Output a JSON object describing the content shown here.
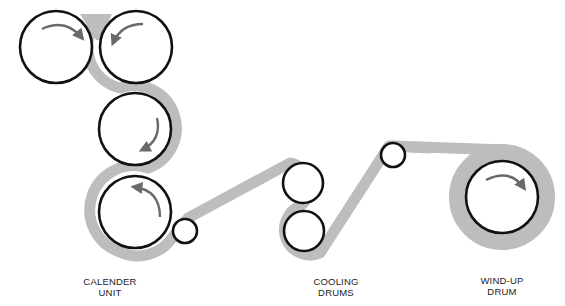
{
  "diagram": {
    "type": "calender process schematic",
    "colors": {
      "roll_outline": "#111111",
      "web_material": "#bdbdbd",
      "arrow": "#6a6a6a",
      "background": "#ffffff"
    },
    "labels": [
      {
        "id": "calender-unit",
        "line1": "CALENDER",
        "line2": "UNIT"
      },
      {
        "id": "cooling-drums",
        "line1": "COOLING",
        "line2": "DRUMS"
      },
      {
        "id": "wind-up-drum",
        "line1": "WIND-UP",
        "line2": "DRUM"
      }
    ],
    "rolls": [
      {
        "name": "calender-roll-1",
        "cx": 56,
        "cy": 47,
        "r": 36,
        "rotation": "clockwise"
      },
      {
        "name": "calender-roll-2",
        "cx": 136,
        "cy": 47,
        "r": 36,
        "rotation": "counterclockwise"
      },
      {
        "name": "calender-roll-3",
        "cx": 135,
        "cy": 129,
        "r": 36,
        "rotation": "clockwise"
      },
      {
        "name": "calender-roll-4",
        "cx": 135,
        "cy": 212,
        "r": 36,
        "rotation": "counterclockwise"
      },
      {
        "name": "guide-roller-1",
        "cx": 185,
        "cy": 231,
        "r": 12
      },
      {
        "name": "cooling-drum-1",
        "cx": 303,
        "cy": 183,
        "r": 20
      },
      {
        "name": "cooling-drum-2",
        "cx": 304,
        "cy": 231,
        "r": 20
      },
      {
        "name": "guide-roller-2",
        "cx": 393,
        "cy": 155,
        "r": 12
      },
      {
        "name": "wind-up-drum",
        "cx": 502,
        "cy": 197,
        "r": 36,
        "wound_outer_r": 53,
        "rotation": "clockwise"
      }
    ]
  }
}
